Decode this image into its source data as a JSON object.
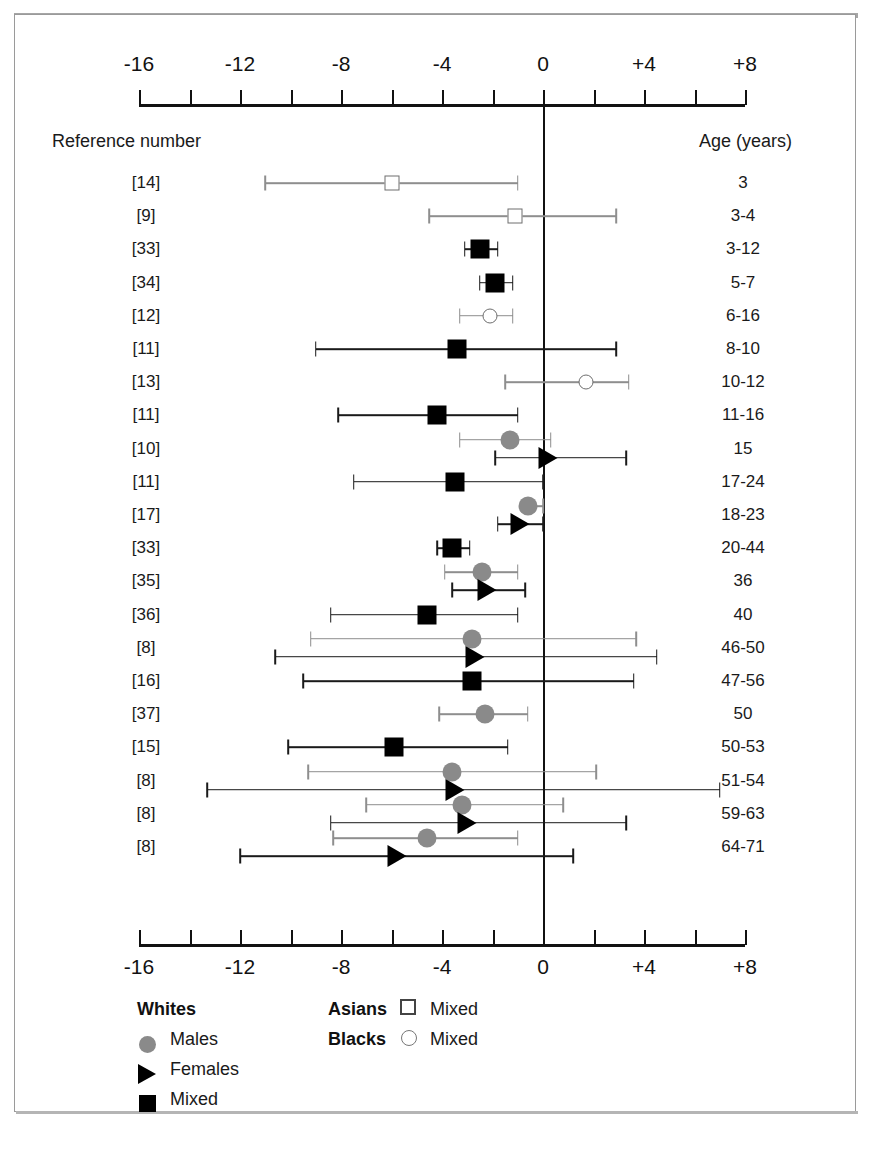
{
  "chart_data": {
    "type": "scatter",
    "title": "",
    "xlabel": "",
    "ylabel": "",
    "grid": false,
    "legend_position": "bottom-left",
    "axis": {
      "tick_labels": [
        "-16",
        "-12",
        "-8",
        "-4",
        "0",
        "+4",
        "+8"
      ],
      "tick_values": [
        -16,
        -12,
        -8,
        -4,
        0,
        4,
        8
      ],
      "minor_tick_step": 2,
      "xlim": [
        -16,
        8
      ],
      "reference_line": 0,
      "duplicated_top_and_bottom": true
    },
    "columns": {
      "reference_header": "Reference number",
      "age_header": "Age (years)"
    },
    "legend": {
      "groups": [
        {
          "title": "Whites",
          "entries": [
            {
              "label": "Males",
              "marker": "filled-grey-circle"
            },
            {
              "label": "Females",
              "marker": "filled-black-triangle"
            },
            {
              "label": "Mixed",
              "marker": "filled-black-square"
            }
          ]
        },
        {
          "title": "Asians",
          "entries": [
            {
              "label": "Mixed",
              "marker": "open-square"
            }
          ]
        },
        {
          "title": "Blacks",
          "entries": [
            {
              "label": "Mixed",
              "marker": "open-circle"
            }
          ]
        }
      ]
    },
    "rows": [
      {
        "reference": "[14]",
        "age": "3",
        "points": [
          {
            "marker": "open-square",
            "value": -6.0,
            "low": -11.0,
            "high": -1.0
          }
        ]
      },
      {
        "reference": "[9]",
        "age": "3-4",
        "points": [
          {
            "marker": "open-square",
            "value": -1.1,
            "low": -4.5,
            "high": 2.9
          }
        ]
      },
      {
        "reference": "[33]",
        "age": "3-12",
        "points": [
          {
            "marker": "filled-black-square",
            "value": -2.5,
            "low": -3.1,
            "high": -1.8
          }
        ]
      },
      {
        "reference": "[34]",
        "age": "5-7",
        "points": [
          {
            "marker": "filled-black-square",
            "value": -1.9,
            "low": -2.5,
            "high": -1.2
          }
        ]
      },
      {
        "reference": "[12]",
        "age": "6-16",
        "points": [
          {
            "marker": "open-circle",
            "value": -2.1,
            "low": -3.3,
            "high": -1.2
          }
        ]
      },
      {
        "reference": "[11]",
        "age": "8-10",
        "points": [
          {
            "marker": "filled-black-square",
            "value": -3.4,
            "low": -9.0,
            "high": 2.9
          }
        ]
      },
      {
        "reference": "[13]",
        "age": "10-12",
        "points": [
          {
            "marker": "open-circle",
            "value": 1.7,
            "low": -1.5,
            "high": 3.4
          }
        ]
      },
      {
        "reference": "[11]",
        "age": "11-16",
        "points": [
          {
            "marker": "filled-black-square",
            "value": -4.2,
            "low": -8.1,
            "high": -1.0
          }
        ]
      },
      {
        "reference": "[10]",
        "age": "15",
        "points": [
          {
            "marker": "filled-grey-circle",
            "value": -1.3,
            "low": -3.3,
            "high": 0.3
          },
          {
            "marker": "filled-black-triangle",
            "value": 0.2,
            "low": -1.9,
            "high": 3.3
          }
        ]
      },
      {
        "reference": "[11]",
        "age": "17-24",
        "points": [
          {
            "marker": "filled-black-square",
            "value": -3.5,
            "low": -7.5,
            "high": 0.0
          }
        ]
      },
      {
        "reference": "[17]",
        "age": "18-23",
        "points": [
          {
            "marker": "filled-grey-circle",
            "value": -0.6,
            "low": -0.6,
            "high": 0.0
          },
          {
            "marker": "filled-black-triangle",
            "value": -0.9,
            "low": -1.8,
            "high": 0.0
          }
        ]
      },
      {
        "reference": "[33]",
        "age": "20-44",
        "points": [
          {
            "marker": "filled-black-square",
            "value": -3.6,
            "low": -4.2,
            "high": -2.9
          }
        ]
      },
      {
        "reference": "[35]",
        "age": "36",
        "points": [
          {
            "marker": "filled-grey-circle",
            "value": -2.4,
            "low": -3.9,
            "high": -1.0
          },
          {
            "marker": "filled-black-triangle",
            "value": -2.2,
            "low": -3.6,
            "high": -0.7
          }
        ]
      },
      {
        "reference": "[36]",
        "age": "40",
        "points": [
          {
            "marker": "filled-black-square",
            "value": -4.6,
            "low": -8.4,
            "high": -1.0
          }
        ]
      },
      {
        "reference": "[8]",
        "age": "46-50",
        "points": [
          {
            "marker": "filled-grey-circle",
            "value": -2.8,
            "low": -9.2,
            "high": 3.7
          },
          {
            "marker": "filled-black-triangle",
            "value": -2.7,
            "low": -10.6,
            "high": 4.5
          }
        ]
      },
      {
        "reference": "[16]",
        "age": "47-56",
        "points": [
          {
            "marker": "filled-black-square",
            "value": -2.8,
            "low": -9.5,
            "high": 3.6
          }
        ]
      },
      {
        "reference": "[37]",
        "age": "50",
        "points": [
          {
            "marker": "filled-grey-circle",
            "value": -2.3,
            "low": -4.1,
            "high": -0.6
          }
        ]
      },
      {
        "reference": "[15]",
        "age": "50-53",
        "points": [
          {
            "marker": "filled-black-square",
            "value": -5.9,
            "low": -10.1,
            "high": -1.4
          }
        ]
      },
      {
        "reference": "[8]",
        "age": "51-54",
        "points": [
          {
            "marker": "filled-grey-circle",
            "value": -3.6,
            "low": -9.3,
            "high": 2.1
          },
          {
            "marker": "filled-black-triangle",
            "value": -3.5,
            "low": -13.3,
            "high": 7.0
          }
        ]
      },
      {
        "reference": "[8]",
        "age": "59-63",
        "points": [
          {
            "marker": "filled-grey-circle",
            "value": -3.2,
            "low": -7.0,
            "high": 0.8
          },
          {
            "marker": "filled-black-triangle",
            "value": -3.0,
            "low": -8.4,
            "high": 3.3
          }
        ]
      },
      {
        "reference": "[8]",
        "age": "64-71",
        "points": [
          {
            "marker": "filled-grey-circle",
            "value": -4.6,
            "low": -8.3,
            "high": -1.0
          },
          {
            "marker": "filled-black-triangle",
            "value": -5.8,
            "low": -12.0,
            "high": 1.2
          }
        ]
      }
    ]
  }
}
